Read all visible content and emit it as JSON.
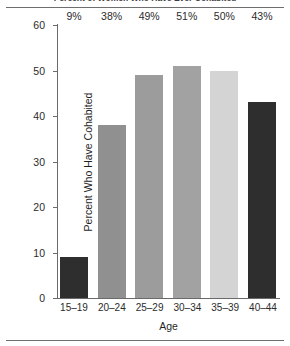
{
  "figure": {
    "title": "Percent of Women Who Have Ever Cohabited",
    "title_cropped": true
  },
  "chart_data": {
    "type": "bar",
    "title": "Percent of Women Who Have Ever Cohabited",
    "xlabel": "Age",
    "ylabel": "Percent Who Have Cohabited",
    "categories": [
      "15–19",
      "20–24",
      "25–29",
      "30–34",
      "35–39",
      "40–44"
    ],
    "values": [
      9,
      38,
      49,
      51,
      50,
      43
    ],
    "value_labels": [
      "9%",
      "38%",
      "49%",
      "51%",
      "50%",
      "43%"
    ],
    "bar_colors": [
      "#2e2e2e",
      "#909090",
      "#9c9c9c",
      "#a2a2a2",
      "#d4d4d4",
      "#2e2e2e"
    ],
    "ylim": [
      0,
      60
    ],
    "yticks": [
      0,
      10,
      20,
      30,
      40,
      50,
      60
    ],
    "ytick_labels": [
      "0",
      "10",
      "20",
      "30",
      "40",
      "50",
      "60"
    ],
    "grid": false,
    "legend": false
  }
}
